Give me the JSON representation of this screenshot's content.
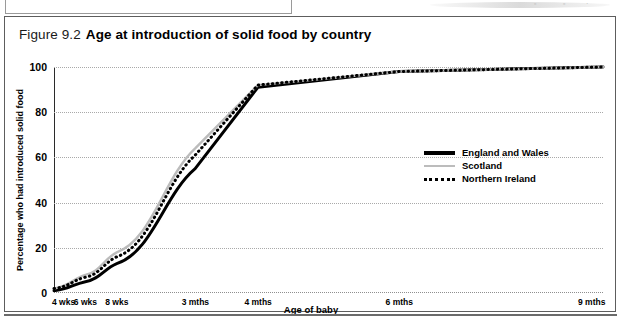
{
  "figure": {
    "number": "Figure 9.2",
    "title": "Age at introduction of solid food  by country"
  },
  "chart_data": {
    "type": "line",
    "title": "Age at introduction of solid food  by country",
    "xlabel": "Age of baby",
    "ylabel": "Percentage who had introduced solid food",
    "ylim": [
      0,
      100
    ],
    "yticks": [
      0,
      20,
      40,
      60,
      80,
      100
    ],
    "grid": true,
    "legend_position": "middle-right",
    "categories": [
      "4 wks",
      "6 wks",
      "8 wks",
      "3 mths",
      "4 mths",
      "6 mths",
      "9 mths"
    ],
    "x_positions": [
      0,
      2,
      4,
      9,
      13,
      22,
      35
    ],
    "x_axis_max": 35,
    "series": [
      {
        "name": "England and Wales",
        "style": "solid-thick",
        "color": "#000000",
        "values": [
          1,
          5,
          13,
          55,
          91,
          98,
          100
        ]
      },
      {
        "name": "Scotland",
        "style": "solid-thin",
        "color": "#bcbcbc",
        "values": [
          2,
          8,
          18,
          64,
          92,
          98,
          100
        ]
      },
      {
        "name": "Northern Ireland",
        "style": "dotted",
        "color": "#000000",
        "values": [
          2,
          7,
          16,
          61,
          92,
          98,
          100
        ]
      }
    ]
  },
  "scan_artifacts": {
    "glyph_a": "▫",
    "glyph_b": "▫",
    "glyph_c": "·"
  }
}
